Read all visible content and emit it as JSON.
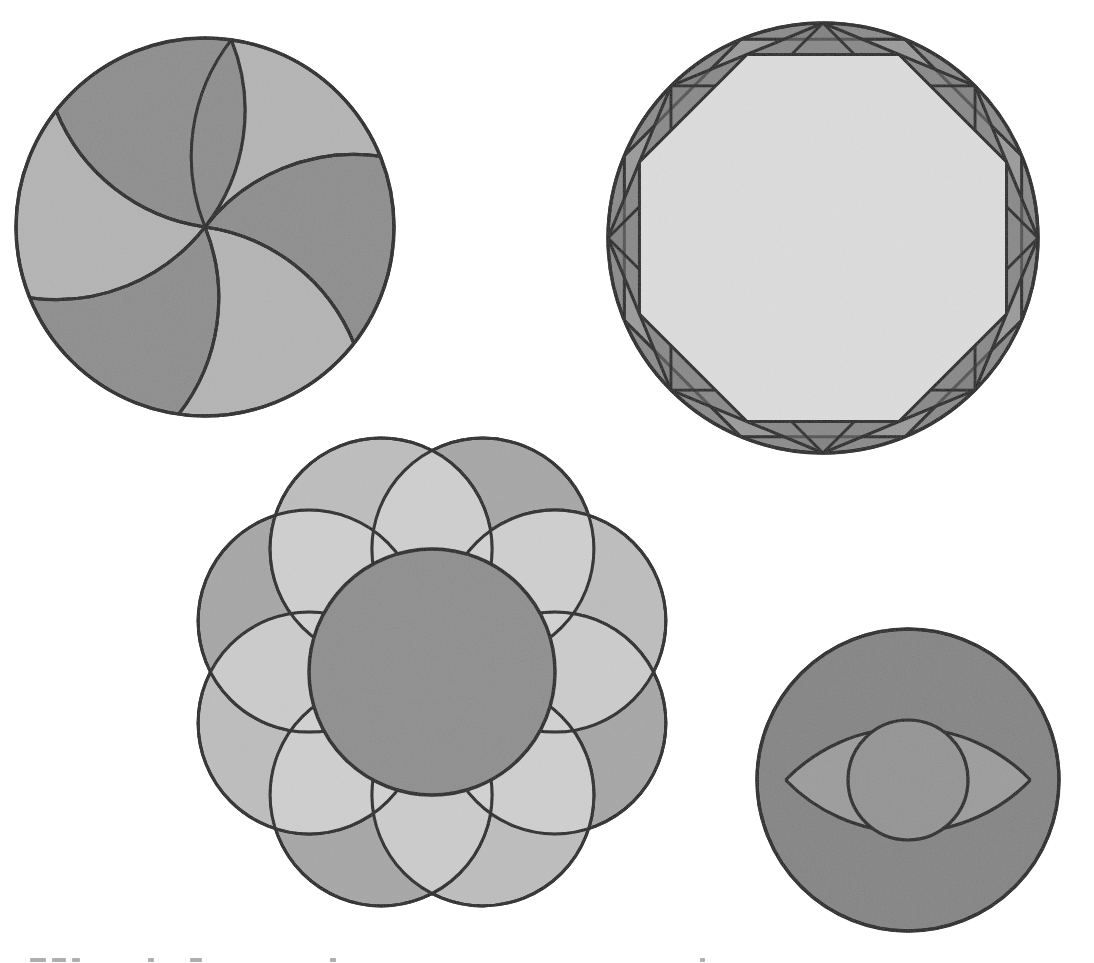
{
  "page": {
    "width": 1094,
    "height": 963,
    "background_color": "#ffffff",
    "stroke_color": "#1e1e1e"
  },
  "palette": {
    "ink": "#1e1e1e",
    "very_light": "#dcdcdc",
    "light": "#c9c9c9",
    "mid_light": "#b9b9b9",
    "mid": "#a8a8a8",
    "mid_dark": "#9a9a9a",
    "dark": "#8a8a8a",
    "darker": "#7c7c7c",
    "darkest": "#6f6f6f",
    "paper": "#ffffff"
  },
  "figures": [
    {
      "id": "rosette-six-petal",
      "name": "Six Petal Rosette In Circle",
      "position": "top-left",
      "center": {
        "x": 205,
        "y": 227
      },
      "radius": 189,
      "petal_count": 6,
      "petal_rotation_deg": 8,
      "background_fill": "#aeaeae",
      "petal_fill_light": "#b4b4b4",
      "petal_fill_dark": "#8d8d8d",
      "stroke_width": 3.2,
      "note": "Six arcs of radius equal to the circle radius swung from six equally spaced points on the circumference, all converging at the centre"
    },
    {
      "id": "octagram-in-circle",
      "name": "Octagon And Star Octagon In Circle",
      "position": "top-right",
      "center": {
        "x": 823,
        "y": 238
      },
      "radius": 215,
      "polygon_sides": 8,
      "polygon_rotation_deg": 22.5,
      "inner_polygon_scale": 0.924,
      "outer_ring_fill": "#8a8a8a",
      "ring_segment_fill_alt": "#7a7a7a",
      "inner_disc_fill": "#dcdcdc",
      "stroke_width": 3.0,
      "note": "Circle with inscribed octagon, a second rotated octagon, and the chords of the star octagon forming triangles in the annulus"
    },
    {
      "id": "flower-of-life",
      "name": "Central Circle With Eight Surrounding Circles",
      "position": "bottom-centre",
      "center": {
        "x": 432,
        "y": 672
      },
      "central_radius": 123,
      "satellite_count": 8,
      "satellite_radius": 111,
      "satellite_ring_radius": 133,
      "satellite_rotation_deg": 22.5,
      "central_fill": "#8e8e8e",
      "satellite_fill_a": "#a6a6a6",
      "satellite_fill_b": "#bdbdbd",
      "overlap_fill": "#d2d2d2",
      "stroke_width": 3.0,
      "note": "Eight equal circles spaced round a central circle, each pair overlapping to leave lens shaped lighter areas"
    },
    {
      "id": "two-arc-lens",
      "name": "Circle With Crossed Arcs And Inner Circle",
      "position": "bottom-right",
      "center": {
        "x": 908,
        "y": 780
      },
      "radius": 151,
      "inner_circle_radius": 60,
      "arc_count": 2,
      "arc_radius": 170,
      "arc_offset": 118,
      "outer_fill": "#848484",
      "lens_fill": "#9c9c9c",
      "inner_circle_fill": "#949494",
      "highlight_fill": "#e2e2e2",
      "stroke_width": 3.0,
      "note": "Two equal arcs swung from opposite centres cross inside the circle, enclosing a small tangent circle and four light curved triangles"
    }
  ],
  "artifacts": {
    "scan_edge_marks": [
      {
        "left": 30,
        "width": 16
      },
      {
        "left": 52,
        "width": 14
      },
      {
        "left": 72,
        "width": 8
      },
      {
        "left": 148,
        "width": 6
      },
      {
        "left": 190,
        "width": 12
      },
      {
        "left": 330,
        "width": 6
      },
      {
        "left": 700,
        "width": 5
      }
    ]
  }
}
